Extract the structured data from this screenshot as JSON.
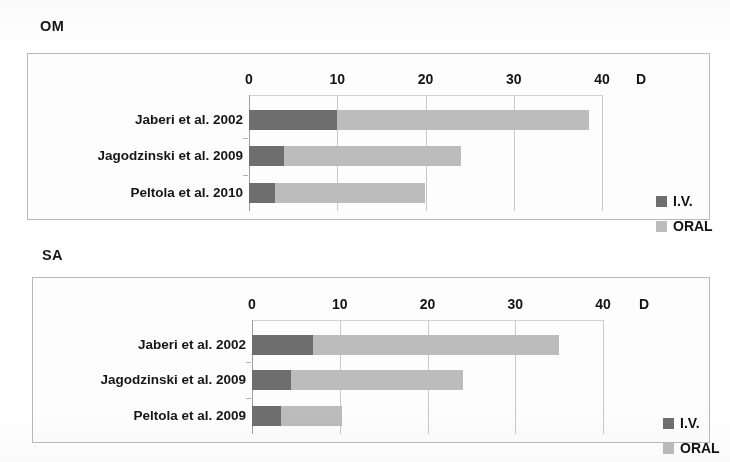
{
  "figure": {
    "background_color": "#ffffff",
    "colors": {
      "iv": "#6e6e6e",
      "oral": "#bcbcbc",
      "frame": "#b9b9b9",
      "gridline": "#c9c9c9",
      "text": "#161616"
    }
  },
  "panels": [
    {
      "key": "om",
      "title": "OM",
      "axis_unit_label": "D",
      "legend": [
        {
          "label": "I.V.",
          "color": "#6e6e6e"
        },
        {
          "label": "ORAL",
          "color": "#bcbcbc"
        }
      ],
      "chart_data": {
        "type": "bar",
        "orientation": "horizontal",
        "stacked": true,
        "title": "OM",
        "xlabel": "D",
        "ylabel": "",
        "xlim": [
          0,
          40
        ],
        "xticks": [
          0,
          10,
          20,
          30,
          40
        ],
        "xtick_labels": [
          "0",
          "10",
          "20",
          "30",
          "40"
        ],
        "grid": true,
        "legend_position": "right",
        "categories": [
          "Jaberi et al. 2002",
          "Jagodzinski et al. 2009",
          "Peltola et al. 2010"
        ],
        "series": [
          {
            "name": "I.V.",
            "color": "#6e6e6e",
            "values": [
              10,
              4,
              3
            ]
          },
          {
            "name": "ORAL",
            "color": "#bcbcbc",
            "values": [
              28.5,
              20,
              17
            ]
          }
        ],
        "totals": [
          38.5,
          24,
          20
        ]
      }
    },
    {
      "key": "sa",
      "title": "SA",
      "axis_unit_label": "D",
      "legend": [
        {
          "label": "I.V.",
          "color": "#6e6e6e"
        },
        {
          "label": "ORAL",
          "color": "#bcbcbc"
        }
      ],
      "chart_data": {
        "type": "bar",
        "orientation": "horizontal",
        "stacked": true,
        "title": "SA",
        "xlabel": "D",
        "ylabel": "",
        "xlim": [
          0,
          40
        ],
        "xticks": [
          0,
          10,
          20,
          30,
          40
        ],
        "xtick_labels": [
          "0",
          "10",
          "20",
          "30",
          "40"
        ],
        "grid": true,
        "legend_position": "right",
        "categories": [
          "Jaberi et al. 2002",
          "Jagodzinski et al. 2009",
          "Peltola et al. 2009"
        ],
        "series": [
          {
            "name": "I.V.",
            "color": "#6e6e6e",
            "values": [
              7,
              4.5,
              3.3
            ]
          },
          {
            "name": "ORAL",
            "color": "#bcbcbc",
            "values": [
              28,
              19.5,
              7
            ]
          }
        ],
        "totals": [
          35,
          24,
          10.3
        ]
      }
    }
  ]
}
